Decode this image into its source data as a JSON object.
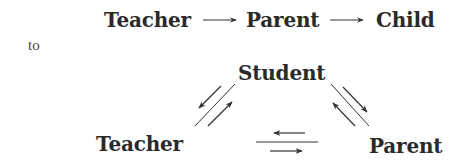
{
  "diagram": {
    "linear": {
      "nodes": [
        "Teacher",
        "Parent",
        "Child"
      ],
      "edges": [
        {
          "from": "Teacher",
          "to": "Parent",
          "direction": "one-way"
        },
        {
          "from": "Parent",
          "to": "Child",
          "direction": "one-way"
        }
      ]
    },
    "connector_word": "to",
    "triangle": {
      "nodes": {
        "top": "Student",
        "left": "Teacher",
        "right": "Parent"
      },
      "edges": [
        {
          "between": [
            "Student",
            "Teacher"
          ],
          "direction": "two-way"
        },
        {
          "between": [
            "Student",
            "Parent"
          ],
          "direction": "two-way"
        },
        {
          "between": [
            "Teacher",
            "Parent"
          ],
          "direction": "two-way"
        }
      ]
    },
    "colors": {
      "text": "#2a2a2a",
      "arrow": "#333333",
      "background": "#ffffff"
    }
  }
}
